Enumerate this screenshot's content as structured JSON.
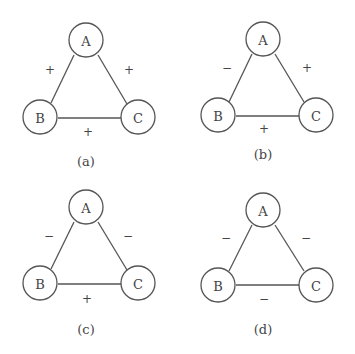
{
  "panels": [
    {
      "caption": "(a)",
      "nodes": {
        "A": "A",
        "B": "B",
        "C": "C"
      },
      "edges": {
        "AB": "+",
        "AC": "+",
        "BC": "+"
      }
    },
    {
      "caption": "(b)",
      "nodes": {
        "A": "A",
        "B": "B",
        "C": "C"
      },
      "edges": {
        "AB": "−",
        "AC": "+",
        "BC": "+"
      }
    },
    {
      "caption": "(c)",
      "nodes": {
        "A": "A",
        "B": "B",
        "C": "C"
      },
      "edges": {
        "AB": "−",
        "AC": "−",
        "BC": "+"
      }
    },
    {
      "caption": "(d)",
      "nodes": {
        "A": "A",
        "B": "B",
        "C": "C"
      },
      "edges": {
        "AB": "−",
        "AC": "−",
        "BC": "−"
      }
    }
  ]
}
